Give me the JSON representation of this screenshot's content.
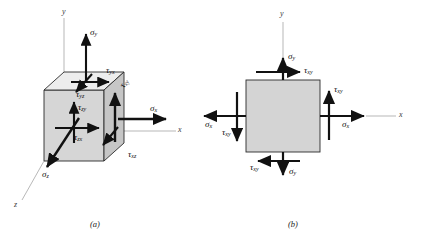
{
  "figure": {
    "title_caption_a": "(a)",
    "title_caption_b": "(b)",
    "colors": {
      "cube_front_face": "#d0d0d0",
      "cube_top_face": "#e8e8e8",
      "cube_side_face": "#c0c0c0",
      "square_fill": "#d2d2d2",
      "outline": "#2b2b2b",
      "arrow": "#111111",
      "axis_line": "#9a9a9a",
      "background": "#ffffff"
    }
  },
  "panel_a": {
    "name": "three-dimensional-stress-element",
    "axes": {
      "y_label": "y",
      "x_label": "x",
      "z_label": "z"
    },
    "stresses": {
      "sigma_y": {
        "symbol": "σ",
        "subscript": "y"
      },
      "sigma_x": {
        "symbol": "σ",
        "subscript": "x"
      },
      "sigma_z": {
        "symbol": "σ",
        "subscript": "z"
      },
      "tau_yx": {
        "symbol": "τ",
        "subscript": "yx"
      },
      "tau_yz": {
        "symbol": "τ",
        "subscript": "yz"
      },
      "tau_zy": {
        "symbol": "τ",
        "subscript": "zy"
      },
      "tau_zx": {
        "symbol": "τ",
        "subscript": "zx"
      },
      "tau_xy": {
        "symbol": "τ",
        "subscript": "xy"
      },
      "tau_xz": {
        "symbol": "τ",
        "subscript": "xz"
      }
    }
  },
  "panel_b": {
    "name": "plane-stress-element",
    "axes": {
      "y_label": "y",
      "x_label": "x"
    },
    "stresses": {
      "sigma_y_top": {
        "symbol": "σ",
        "subscript": "y"
      },
      "sigma_y_bottom": {
        "symbol": "σ",
        "subscript": "y"
      },
      "sigma_x_right": {
        "symbol": "σ",
        "subscript": "x"
      },
      "sigma_x_left": {
        "symbol": "σ",
        "subscript": "x"
      },
      "tau_xy_top": {
        "symbol": "τ",
        "subscript": "xy"
      },
      "tau_xy_right": {
        "symbol": "τ",
        "subscript": "xy"
      },
      "tau_xy_bottom": {
        "symbol": "τ",
        "subscript": "xy"
      },
      "tau_xy_left": {
        "symbol": "τ",
        "subscript": "xy"
      }
    }
  }
}
